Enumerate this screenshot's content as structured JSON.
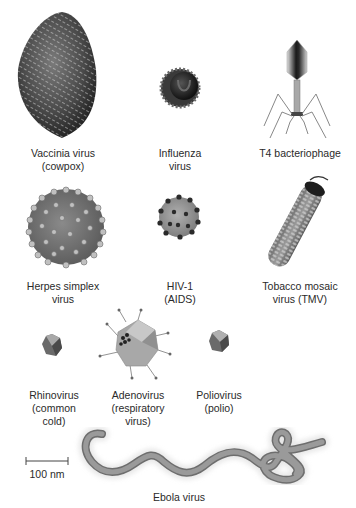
{
  "figure": {
    "viruses": [
      {
        "id": "vaccinia",
        "line1": "Vaccinia virus",
        "line2": "(cowpox)"
      },
      {
        "id": "influenza",
        "line1": "Influenza",
        "line2": "virus"
      },
      {
        "id": "t4",
        "line1": "T4 bacteriophage",
        "line2": ""
      },
      {
        "id": "herpes",
        "line1": "Herpes simplex",
        "line2": "virus"
      },
      {
        "id": "hiv",
        "line1": "HIV-1",
        "line2": "(AIDS)"
      },
      {
        "id": "tmv",
        "line1": "Tobacco mosaic",
        "line2": "virus (TMV)"
      },
      {
        "id": "rhinovirus",
        "line1": "Rhinovirus",
        "line2": "(common",
        "line3": "cold)"
      },
      {
        "id": "adenovirus",
        "line1": "Adenovirus",
        "line2": "(respiratory",
        "line3": "virus)"
      },
      {
        "id": "poliovirus",
        "line1": "Poliovirus",
        "line2": "(polio)"
      },
      {
        "id": "ebola",
        "line1": "Ebola virus",
        "line2": ""
      }
    ],
    "scale_bar": {
      "label": "100 nm"
    },
    "colors": {
      "background": "#ffffff",
      "text": "#2a2a2a",
      "virus_dark": "#3a3a3a",
      "virus_mid": "#8a8a8a",
      "virus_light": "#c8c8c8",
      "ebola": "#8c8c8c"
    }
  }
}
